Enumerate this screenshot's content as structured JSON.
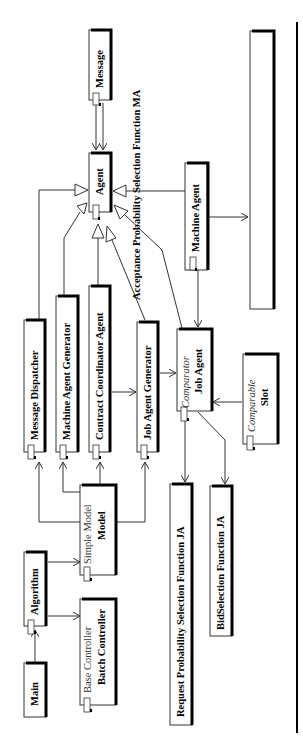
{
  "diagram": {
    "type": "UML class diagram (rotated 90 degrees)",
    "classes": {
      "message": {
        "name": "Message"
      },
      "agent": {
        "name": "Agent"
      },
      "machine_agent": {
        "name": "Machine Agent"
      },
      "message_dispatcher": {
        "name": "Message Dispatcher"
      },
      "machine_agent_generator": {
        "name": "Machine Agent Generator"
      },
      "contract_coordinator_agent": {
        "name": "Contract Coordinator Agent"
      },
      "job_agent_generator": {
        "name": "Job Agent Generator"
      },
      "job_agent": {
        "name": "Job Agent",
        "stereotype": "Comparator"
      },
      "slot": {
        "name": "Slot",
        "stereotype": "Comparable"
      },
      "model": {
        "name": "Model",
        "stereotype": "Simple Model"
      },
      "algorithm": {
        "name": "Algorithm"
      },
      "main": {
        "name": "Main"
      },
      "batch_controller": {
        "name": "Batch Controller",
        "stereotype": "Base Controller"
      },
      "request_probability": {
        "name": "Request Probability Selection Function JA"
      },
      "bid_selection": {
        "name": "BidSelection Function JA"
      },
      "acceptance_probability": {
        "name": "Acceptance Probability Selection Function MA"
      },
      "empty_box": {
        "name": ""
      }
    },
    "relations": [
      {
        "from": "Message",
        "to": "Agent",
        "kind": "association"
      },
      {
        "from": "Machine Agent",
        "to": "Agent",
        "kind": "generalization"
      },
      {
        "from": "Message Dispatcher",
        "to": "Agent",
        "kind": "generalization"
      },
      {
        "from": "Machine Agent Generator",
        "to": "Agent",
        "kind": "generalization"
      },
      {
        "from": "Contract Coordinator Agent",
        "to": "Agent",
        "kind": "generalization"
      },
      {
        "from": "Job Agent Generator",
        "to": "Agent",
        "kind": "generalization"
      },
      {
        "from": "Job Agent",
        "to": "Agent",
        "kind": "generalization"
      },
      {
        "from": "Machine Agent",
        "to": "Job Agent",
        "kind": "association"
      },
      {
        "from": "Machine Agent",
        "to": "Acceptance Probability Selection Function MA",
        "kind": "association"
      },
      {
        "from": "Contract Coordinator Agent",
        "to": "Job Agent Generator",
        "kind": "association"
      },
      {
        "from": "Job Agent Generator",
        "to": "Job Agent",
        "kind": "association"
      },
      {
        "from": "Slot",
        "to": "Job Agent",
        "kind": "association"
      },
      {
        "from": "Job Agent",
        "to": "Request Probability Selection Function JA",
        "kind": "association"
      },
      {
        "from": "Job Agent",
        "to": "BidSelection Function JA",
        "kind": "association"
      },
      {
        "from": "Model",
        "to": "Message Dispatcher",
        "kind": "association"
      },
      {
        "from": "Model",
        "to": "Machine Agent Generator",
        "kind": "association"
      },
      {
        "from": "Model",
        "to": "Contract Coordinator Agent",
        "kind": "association"
      },
      {
        "from": "Model",
        "to": "Job Agent Generator",
        "kind": "association"
      },
      {
        "from": "Algorithm",
        "to": "Model",
        "kind": "association"
      },
      {
        "from": "Algorithm",
        "to": "Batch Controller",
        "kind": "association"
      },
      {
        "from": "Main",
        "to": "Algorithm",
        "kind": "association"
      }
    ]
  }
}
